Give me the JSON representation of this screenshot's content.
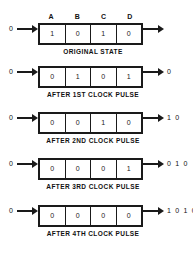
{
  "diagram": {
    "column_headers": [
      "A",
      "B",
      "C",
      "D"
    ],
    "ink_color": "#1a1a1a",
    "background_color": "#ffffff",
    "rows": [
      {
        "input": "0",
        "cells": [
          "1",
          "0",
          "1",
          "0"
        ],
        "output": "",
        "caption": "ORIGINAL STATE"
      },
      {
        "input": "0",
        "cells": [
          "0",
          "1",
          "0",
          "1"
        ],
        "output": "0",
        "caption": "AFTER 1ST CLOCK PULSE"
      },
      {
        "input": "0",
        "cells": [
          "0",
          "0",
          "1",
          "0"
        ],
        "output": "1 0",
        "caption": "AFTER 2ND CLOCK PULSE"
      },
      {
        "input": "0",
        "cells": [
          "0",
          "0",
          "0",
          "1"
        ],
        "output": "0 1 0",
        "caption": "AFTER 3RD CLOCK PULSE"
      },
      {
        "input": "0",
        "cells": [
          "0",
          "0",
          "0",
          "0"
        ],
        "output": "1 0 1 0",
        "caption": "AFTER 4TH CLOCK PULSE"
      }
    ]
  }
}
